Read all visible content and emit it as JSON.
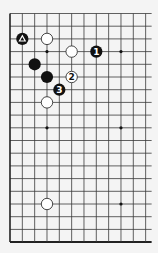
{
  "diagram": {
    "type": "go-board-partial",
    "grid": {
      "columns": 12,
      "rows": 19,
      "origin_x": 10,
      "origin_y": 13.5,
      "col_spacing": 12.33,
      "row_spacing": 12.7,
      "right_overhang": 6,
      "line_color": "#3a3a3a",
      "edge_color": "#222222",
      "background": "#f4f4f4"
    },
    "edges": {
      "left": true,
      "bottom": true,
      "top": false,
      "right": false
    },
    "star_points": [
      {
        "col": 3,
        "row": 3
      },
      {
        "col": 9,
        "row": 3
      },
      {
        "col": 3,
        "row": 9
      },
      {
        "col": 9,
        "row": 9
      },
      {
        "col": 3,
        "row": 15
      },
      {
        "col": 9,
        "row": 15
      }
    ],
    "stones": [
      {
        "color": "black",
        "col": 1,
        "row": 2,
        "label": "△",
        "marker": "triangle"
      },
      {
        "color": "white",
        "col": 3,
        "row": 2,
        "label": ""
      },
      {
        "color": "white",
        "col": 5,
        "row": 3,
        "label": ""
      },
      {
        "color": "black",
        "col": 7,
        "row": 3,
        "label": "1"
      },
      {
        "color": "black",
        "col": 2,
        "row": 4,
        "label": ""
      },
      {
        "color": "black",
        "col": 3,
        "row": 5,
        "label": ""
      },
      {
        "color": "white",
        "col": 5,
        "row": 5,
        "label": "2"
      },
      {
        "color": "black",
        "col": 4,
        "row": 6,
        "label": "3"
      },
      {
        "color": "white",
        "col": 3,
        "row": 7,
        "label": ""
      },
      {
        "color": "white",
        "col": 3,
        "row": 15,
        "label": ""
      }
    ],
    "colors": {
      "black_stone": "#111111",
      "white_stone": "#ffffff",
      "white_stroke": "#333333",
      "label_on_black": "#ffffff",
      "label_on_white": "#111111"
    }
  }
}
